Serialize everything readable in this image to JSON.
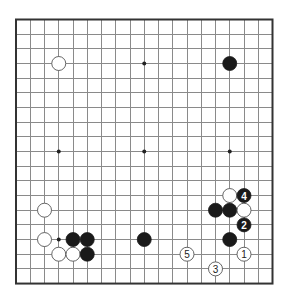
{
  "board": {
    "size": 19,
    "origin_x": 16,
    "origin_y": 19.5,
    "spacing_x": 14.25,
    "spacing_y": 14.67,
    "stone_diameter": 14,
    "colors": {
      "black_stone": "#1a1a1a",
      "white_stone": "#ffffff",
      "grid": "#8a8a8a",
      "border": "#333333"
    }
  },
  "hoshi": [
    {
      "col": 3,
      "row": 3
    },
    {
      "col": 9,
      "row": 3
    },
    {
      "col": 15,
      "row": 3
    },
    {
      "col": 3,
      "row": 9
    },
    {
      "col": 9,
      "row": 9
    },
    {
      "col": 15,
      "row": 9
    },
    {
      "col": 3,
      "row": 15
    },
    {
      "col": 9,
      "row": 15
    },
    {
      "col": 15,
      "row": 15
    }
  ],
  "stones": [
    {
      "color": "white",
      "col": 3,
      "row": 3,
      "label": ""
    },
    {
      "color": "black",
      "col": 15,
      "row": 3,
      "label": ""
    },
    {
      "color": "white",
      "col": 2,
      "row": 13,
      "label": ""
    },
    {
      "color": "white",
      "col": 2,
      "row": 15,
      "label": ""
    },
    {
      "color": "black",
      "col": 4,
      "row": 15,
      "label": ""
    },
    {
      "color": "black",
      "col": 5,
      "row": 15,
      "label": ""
    },
    {
      "color": "white",
      "col": 3,
      "row": 16,
      "label": ""
    },
    {
      "color": "white",
      "col": 4,
      "row": 16,
      "label": ""
    },
    {
      "color": "black",
      "col": 5,
      "row": 16,
      "label": ""
    },
    {
      "color": "black",
      "col": 9,
      "row": 15,
      "label": ""
    },
    {
      "color": "white",
      "col": 15,
      "row": 12,
      "label": ""
    },
    {
      "color": "black",
      "col": 16,
      "row": 12,
      "label": "4"
    },
    {
      "color": "black",
      "col": 14,
      "row": 13,
      "label": ""
    },
    {
      "color": "black",
      "col": 15,
      "row": 13,
      "label": ""
    },
    {
      "color": "white",
      "col": 16,
      "row": 13,
      "label": ""
    },
    {
      "color": "black",
      "col": 16,
      "row": 14,
      "label": "2"
    },
    {
      "color": "black",
      "col": 15,
      "row": 15,
      "label": ""
    },
    {
      "color": "white",
      "col": 12,
      "row": 16,
      "label": "5"
    },
    {
      "color": "white",
      "col": 16,
      "row": 16,
      "label": "1"
    },
    {
      "color": "white",
      "col": 14,
      "row": 17,
      "label": "3"
    }
  ]
}
